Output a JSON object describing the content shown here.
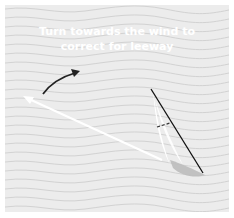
{
  "diagram": {
    "caption": {
      "line1": "Turn towards the wind to",
      "line2": "correct for leeway"
    },
    "elements": {
      "background": "wavy-water-pattern",
      "turn_arrow": "curved-black-arrow",
      "heading_arrow": "white-straight-arrow",
      "boat": "sailboat-top-view"
    },
    "colors": {
      "background": "#ececec",
      "wave_lines": "#d2d2d2",
      "caption_text": "#ffffff",
      "turn_arrow": "#222222",
      "heading_arrow": "#ffffff",
      "boat_shadow": "#bdbdbd",
      "mast_line": "#111111"
    }
  }
}
